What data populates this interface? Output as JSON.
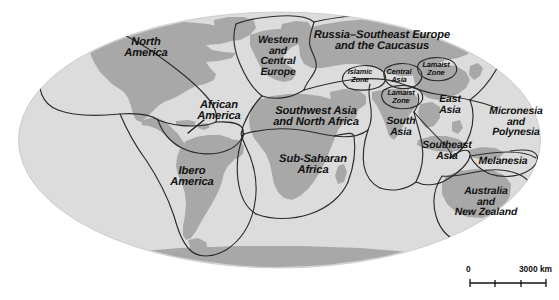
{
  "figure": {
    "type": "world-culture-regions-map",
    "projection": "elliptical (Mollweide-like)",
    "width": 559,
    "height": 300
  },
  "colors": {
    "page_background": "#ffffff",
    "ocean": "#dcdcdc",
    "land": "#a8a8a8",
    "region_border": "#2b2b2b",
    "label_text": "#111111",
    "map_outline": "#d0d0d0"
  },
  "regions": [
    {
      "id": "north-america",
      "label": "North\nAmerica",
      "x": 146,
      "y": 48,
      "size": "sz-lg"
    },
    {
      "id": "african-america",
      "label": "African\nAmerica",
      "x": 219,
      "y": 111,
      "size": "sz-lg"
    },
    {
      "id": "ibero-america",
      "label": "Ibero\nAmerica",
      "x": 192,
      "y": 177,
      "size": "sz-lg"
    },
    {
      "id": "western-central-europe",
      "label": "Western\nand\nCentral\nEurope",
      "x": 278,
      "y": 57,
      "size": "sz-md"
    },
    {
      "id": "russia-se-europe-caucasus",
      "label": "Russia–Southeast Europe\nand the Caucasus",
      "x": 382,
      "y": 41,
      "size": "sz-lg"
    },
    {
      "id": "islamic-zone",
      "label": "Islamic\nZone",
      "x": 360,
      "y": 76,
      "size": "sz-xs"
    },
    {
      "id": "central-asia",
      "label": "Central\nAsia",
      "x": 399,
      "y": 76,
      "size": "sz-xs"
    },
    {
      "id": "lamaist-zone-north",
      "label": "Lamaist\nZone",
      "x": 436,
      "y": 69,
      "size": "sz-xs"
    },
    {
      "id": "lamaist-zone-south",
      "label": "Lamaist\nZone",
      "x": 401,
      "y": 97,
      "size": "sz-xs"
    },
    {
      "id": "southwest-asia-north-africa",
      "label": "Southwest Asia\nand North Africa",
      "x": 316,
      "y": 117,
      "size": "sz-lg"
    },
    {
      "id": "south-asia",
      "label": "South\nAsia",
      "x": 401,
      "y": 128,
      "size": "sz-md"
    },
    {
      "id": "east-asia",
      "label": "East\nAsia",
      "x": 450,
      "y": 106,
      "size": "sz-md"
    },
    {
      "id": "sub-saharan-africa",
      "label": "Sub-Saharan\nAfrica",
      "x": 313,
      "y": 165,
      "size": "sz-lg"
    },
    {
      "id": "southeast-asia",
      "label": "Southeast\nAsia",
      "x": 447,
      "y": 152,
      "size": "sz-md"
    },
    {
      "id": "micronesia-polynesia",
      "label": "Micronesia\nand\nPolynesia",
      "x": 516,
      "y": 123,
      "size": "sz-md"
    },
    {
      "id": "melanesia",
      "label": "Melanesia",
      "x": 503,
      "y": 162,
      "size": "sz-md"
    },
    {
      "id": "australia-new-zealand",
      "label": "Australia\nand\nNew Zealand",
      "x": 486,
      "y": 203,
      "size": "sz-md"
    }
  ],
  "scale_bar": {
    "min_label": "0",
    "max_label": "3000 km",
    "ticks": 3
  }
}
